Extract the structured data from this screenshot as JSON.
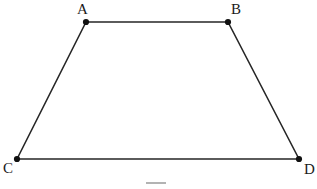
{
  "figure": {
    "type": "geometry-diagram",
    "shape_name": "trapezoid",
    "background_color": "#ffffff",
    "stroke_color": "#262626",
    "stroke_width": 1.6,
    "vertex_dot_color": "#111111",
    "vertex_dot_radius": 3.1,
    "label_color": "#1a1a1a",
    "label_font_size": 15,
    "canvas": {
      "width": 317,
      "height": 189
    },
    "vertices": [
      {
        "id": "A",
        "label": "A",
        "x": 86,
        "y": 22,
        "label_x": 77,
        "label_y": 2,
        "label_position": "above-left"
      },
      {
        "id": "B",
        "label": "B",
        "x": 228,
        "y": 22,
        "label_x": 231,
        "label_y": 2,
        "label_position": "above-right"
      },
      {
        "id": "C",
        "label": "C",
        "x": 17,
        "y": 159,
        "label_x": 3,
        "label_y": 161,
        "label_position": "below-left"
      },
      {
        "id": "D",
        "label": "D",
        "x": 299,
        "y": 159,
        "label_x": 304,
        "label_y": 162,
        "label_position": "below-right"
      }
    ],
    "edges": [
      {
        "id": "AB",
        "from": "A",
        "to": "B",
        "x1": 86,
        "y1": 22,
        "x2": 228,
        "y2": 22
      },
      {
        "id": "BD",
        "from": "B",
        "to": "D",
        "x1": 228,
        "y1": 22,
        "x2": 299,
        "y2": 159
      },
      {
        "id": "DC",
        "from": "D",
        "to": "C",
        "x1": 299,
        "y1": 159,
        "x2": 17,
        "y2": 159
      },
      {
        "id": "CA",
        "from": "C",
        "to": "A",
        "x1": 17,
        "y1": 159,
        "x2": 86,
        "y2": 22
      }
    ],
    "caption_fragment": {
      "visible": true,
      "description": "faint clipped gray mark at bottom center",
      "color": "#9a9a9a"
    }
  }
}
